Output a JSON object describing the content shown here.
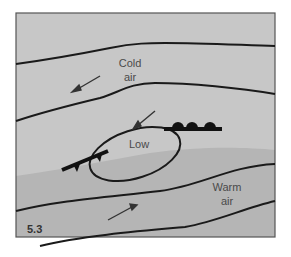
{
  "figure": {
    "number": "5.3",
    "labels": {
      "cold_air_line1": "Cold",
      "cold_air_line2": "air",
      "low": "Low",
      "warm_air_line1": "Warm",
      "warm_air_line2": "air"
    },
    "colors": {
      "background": "#ffffff",
      "cold_region": "#c7c7c7",
      "warm_region": "#b5b5b5",
      "frame": "#555555",
      "lines": "#1a1a1a"
    },
    "elements": [
      "isobar lines (4)",
      "low pressure ellipse",
      "warm front (semicircles)",
      "cold front (triangles)",
      "wind arrows (3)"
    ]
  }
}
